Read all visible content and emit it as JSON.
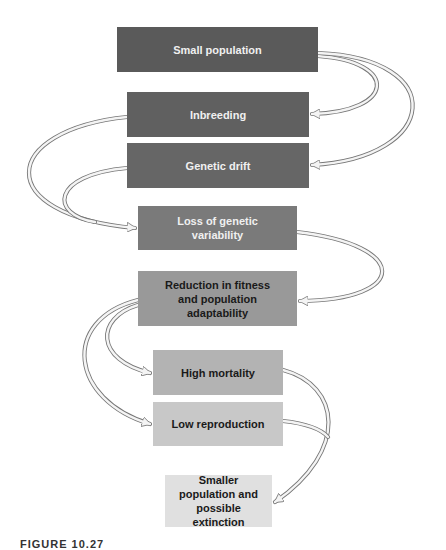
{
  "diagram": {
    "boxes": [
      {
        "id": "small-population",
        "label": "Small population",
        "fill": "#5a5a5a",
        "text": "#f0f0f0"
      },
      {
        "id": "inbreeding",
        "label": "Inbreeding",
        "fill": "#606060",
        "text": "#f0f0f0"
      },
      {
        "id": "genetic-drift",
        "label": "Genetic drift",
        "fill": "#666666",
        "text": "#f0f0f0"
      },
      {
        "id": "loss-of-genetic-variability",
        "label": "Loss of genetic\nvariability",
        "fill": "#7a7a7a",
        "text": "#f0f0f0"
      },
      {
        "id": "reduction-in-fitness",
        "label": "Reduction in fitness\nand population\nadaptability",
        "fill": "#999999",
        "text": "#1a1a1a"
      },
      {
        "id": "high-mortality",
        "label": "High mortality",
        "fill": "#b3b3b3",
        "text": "#1a1a1a"
      },
      {
        "id": "low-reproduction",
        "label": "Low reproduction",
        "fill": "#c8c8c8",
        "text": "#1a1a1a"
      },
      {
        "id": "smaller-population",
        "label": "Smaller\npopulation and\npossible extinction",
        "fill": "#e0e0e0",
        "text": "#1a1a1a"
      }
    ],
    "edges": [
      {
        "from": "small-population",
        "to": "inbreeding"
      },
      {
        "from": "small-population",
        "to": "genetic-drift"
      },
      {
        "from": "inbreeding",
        "to": "loss-of-genetic-variability"
      },
      {
        "from": "genetic-drift",
        "to": "loss-of-genetic-variability"
      },
      {
        "from": "loss-of-genetic-variability",
        "to": "reduction-in-fitness"
      },
      {
        "from": "reduction-in-fitness",
        "to": "high-mortality"
      },
      {
        "from": "reduction-in-fitness",
        "to": "low-reproduction"
      },
      {
        "from": "high-mortality",
        "to": "smaller-population"
      },
      {
        "from": "low-reproduction",
        "to": "smaller-population"
      }
    ]
  },
  "caption": "FIGURE 10.27"
}
